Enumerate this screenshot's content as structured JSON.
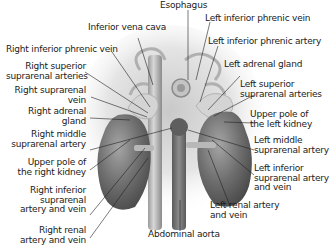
{
  "diagram": {
    "palette": {
      "kidney": "#6e6e6e",
      "vessel": "#a8a8a8",
      "background": "#ffffff",
      "text": "#1a1a1a",
      "leader": "#222222"
    },
    "labels_top": [
      {
        "id": "esophagus",
        "text": "Esophagus"
      },
      {
        "id": "ivc",
        "text": "Inferior vena cava"
      }
    ],
    "labels_left": [
      {
        "id": "r-inf-phrenic-vein",
        "lines": [
          "Right inferior phrenic vein"
        ]
      },
      {
        "id": "r-sup-suprarenal-arteries",
        "lines": [
          "Right superior",
          "suprarenal arteries"
        ]
      },
      {
        "id": "r-suprarenal-vein",
        "lines": [
          "Right suprarenal",
          "vein"
        ]
      },
      {
        "id": "r-adrenal-gland",
        "lines": [
          "Right adrenal",
          "gland"
        ]
      },
      {
        "id": "r-mid-suprarenal-artery",
        "lines": [
          "Right middle",
          "suprarenal artery"
        ]
      },
      {
        "id": "r-upper-pole-kidney",
        "lines": [
          "Upper pole of",
          "the right kidney"
        ]
      },
      {
        "id": "r-inf-suprarenal-av",
        "lines": [
          "Right inferior",
          "suprarenal",
          "artery and vein"
        ]
      },
      {
        "id": "r-renal-av",
        "lines": [
          "Right renal",
          "artery and vein"
        ]
      }
    ],
    "labels_right": [
      {
        "id": "l-inf-phrenic-vein",
        "lines": [
          "Left inferior phrenic vein"
        ]
      },
      {
        "id": "l-inf-phrenic-artery",
        "lines": [
          "Left inferior phrenic artery"
        ]
      },
      {
        "id": "l-adrenal-gland",
        "lines": [
          "Left adrenal gland"
        ]
      },
      {
        "id": "l-sup-suprarenal-arteries",
        "lines": [
          "Left superior",
          "suprarenal arteries"
        ]
      },
      {
        "id": "l-upper-pole-kidney",
        "lines": [
          "Upper pole of",
          "the left kidney"
        ]
      },
      {
        "id": "l-mid-suprarenal-artery",
        "lines": [
          "Left middle",
          "suprarenal artery"
        ]
      },
      {
        "id": "l-inf-suprarenal-av",
        "lines": [
          "Left inferior",
          "suprarenal artery",
          "and vein"
        ]
      },
      {
        "id": "l-renal-av",
        "lines": [
          "Left renal artery",
          "and vein"
        ]
      }
    ],
    "labels_bottom": [
      {
        "id": "abdominal-aorta",
        "text": "Abdominal aorta"
      }
    ]
  }
}
